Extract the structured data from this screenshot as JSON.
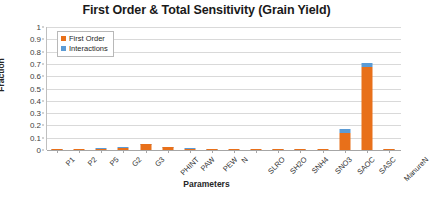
{
  "chart_data": {
    "type": "bar",
    "title": "First Order & Total Sensitivity (Grain Yield)",
    "xlabel": "Parameters",
    "ylabel": "Fraction",
    "ylim": [
      0,
      1
    ],
    "ytick_labels": [
      "1",
      "0.9",
      "0.8",
      "0.7",
      "0.6",
      "0.5",
      "0.4",
      "0.3",
      "0.2",
      "0.1",
      "0"
    ],
    "ytick_values": [
      1,
      0.9,
      0.8,
      0.7,
      0.6,
      0.5,
      0.4,
      0.3,
      0.2,
      0.1,
      0
    ],
    "grid": true,
    "stacked": true,
    "legend_position": "top-left",
    "categories": [
      "P1",
      "P2",
      "P5",
      "G2",
      "G3",
      "PHINT",
      "PAW",
      "PEW",
      "N",
      "SLRO",
      "SH2O",
      "SNH4",
      "SNO3",
      "SAOC",
      "SASC",
      "ManureN"
    ],
    "series": [
      {
        "name": "First Order",
        "color": "#e8701a",
        "values": [
          0.002,
          0.001,
          0.012,
          0.018,
          0.045,
          0.022,
          0.008,
          0.006,
          0.001,
          0.001,
          0.003,
          0.002,
          0.001,
          0.135,
          0.675,
          0.002
        ]
      },
      {
        "name": "Interactions",
        "color": "#5b9bd5",
        "values": [
          0.001,
          0.0,
          0.002,
          0.002,
          0.003,
          0.002,
          0.001,
          0.002,
          0.0,
          0.0,
          0.001,
          0.001,
          0.0,
          0.035,
          0.03,
          0.001
        ]
      }
    ]
  },
  "legend": {
    "items": [
      {
        "label": "First Order",
        "color": "#e8701a"
      },
      {
        "label": "Interactions",
        "color": "#5b9bd5"
      }
    ]
  }
}
